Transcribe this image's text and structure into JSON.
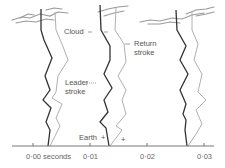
{
  "diagram": {
    "labels": {
      "cloud": "Cloud",
      "return_stroke_line1": "Return",
      "return_stroke_line2": "stroke",
      "leader_stroke_line1": "Leader",
      "leader_stroke_line2": "stroke",
      "earth": "Earth",
      "earth_sign": "+",
      "plus_sign": "+"
    },
    "axis": {
      "ticks": [
        {
          "label": "0·00 seconds",
          "value": 0.0
        },
        {
          "label": "0·01",
          "value": 0.01
        },
        {
          "label": "0·02",
          "value": 0.02
        },
        {
          "label": "0·03",
          "value": 0.03
        }
      ]
    },
    "strokes": [
      {
        "time": 0.003,
        "leader_color": "#333333",
        "return_color": "#aaaaaa"
      },
      {
        "time": 0.013,
        "leader_color": "#333333",
        "return_color": "#aaaaaa"
      },
      {
        "time": 0.027,
        "leader_color": "#333333",
        "return_color": "#aaaaaa"
      }
    ],
    "colors": {
      "leader": "#333333",
      "return": "#aaaaaa",
      "cloud": "#888888",
      "axis": "#555555"
    }
  }
}
